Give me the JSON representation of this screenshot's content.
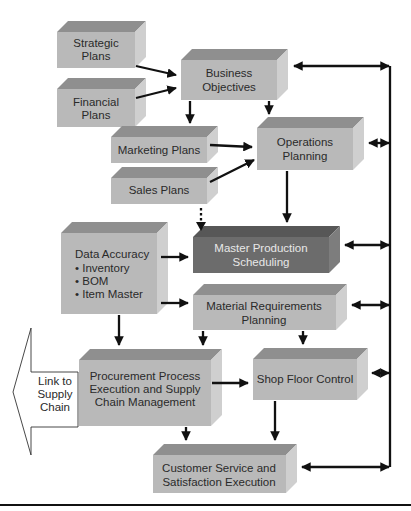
{
  "diagram": {
    "colors": {
      "box_front": "#b9b9b9",
      "box_top": "#8f8f8f",
      "box_side": "#cfcfcf",
      "mps_front": "#6c6c6c",
      "mps_top": "#575757",
      "mps_side": "#7d7d7d",
      "arrow": "#111111",
      "text": "#2a2a2a",
      "text_on_dark": "#e8e8e8"
    },
    "nodes": {
      "strategic_plans": {
        "lines": [
          "Strategic",
          "Plans"
        ]
      },
      "financial_plans": {
        "lines": [
          "Financial",
          "Plans"
        ]
      },
      "business_objectives": {
        "lines": [
          "Business",
          "Objectives"
        ]
      },
      "marketing_plans": {
        "lines": [
          "Marketing Plans"
        ]
      },
      "operations_planning": {
        "lines": [
          "Operations",
          "Planning"
        ]
      },
      "sales_plans": {
        "lines": [
          "Sales Plans"
        ]
      },
      "data_accuracy": {
        "lines": [
          "Data Accuracy",
          "• Inventory",
          "• BOM",
          "• Item Master"
        ]
      },
      "master_production_scheduling": {
        "lines": [
          "Master Production",
          "Scheduling"
        ]
      },
      "material_requirements_planning": {
        "lines": [
          "Material Requirements",
          "Planning"
        ]
      },
      "procurement": {
        "lines": [
          "Procurement Process",
          "Execution and Supply",
          "Chain Management"
        ]
      },
      "shop_floor_control": {
        "lines": [
          "Shop Floor Control"
        ]
      },
      "customer_service": {
        "lines": [
          "Customer Service and",
          "Satisfaction Execution"
        ]
      },
      "link_to_supply_chain": {
        "lines": [
          "Link to",
          "Supply",
          "Chain"
        ]
      }
    },
    "edges": [
      {
        "from": "Strategic Plans",
        "to": "Business Objectives",
        "type": "arrow"
      },
      {
        "from": "Financial Plans",
        "to": "Business Objectives",
        "type": "arrow"
      },
      {
        "from": "Business Objectives",
        "to": "Marketing Plans",
        "type": "arrow"
      },
      {
        "from": "Business Objectives",
        "to": "Operations Planning",
        "type": "arrow"
      },
      {
        "from": "Marketing Plans",
        "to": "Operations Planning",
        "type": "arrow"
      },
      {
        "from": "Sales Plans",
        "to": "Operations Planning",
        "type": "arrow"
      },
      {
        "from": "Sales Plans",
        "to": "Master Production Scheduling",
        "type": "dotted-arrow"
      },
      {
        "from": "Operations Planning",
        "to": "Master Production Scheduling",
        "type": "arrow"
      },
      {
        "from": "Data Accuracy",
        "to": "Master Production Scheduling",
        "type": "arrow"
      },
      {
        "from": "Data Accuracy",
        "to": "Material Requirements Planning",
        "type": "arrow"
      },
      {
        "from": "Data Accuracy",
        "to": "Procurement Process Execution and Supply Chain Management",
        "type": "arrow"
      },
      {
        "from": "Material Requirements Planning",
        "to": "Procurement Process Execution and Supply Chain Management",
        "type": "arrow"
      },
      {
        "from": "Material Requirements Planning",
        "to": "Shop Floor Control",
        "type": "arrow"
      },
      {
        "from": "Procurement Process Execution and Supply Chain Management",
        "to": "Shop Floor Control",
        "type": "arrow"
      },
      {
        "from": "Procurement Process Execution and Supply Chain Management",
        "to": "Customer Service and Satisfaction Execution",
        "type": "arrow"
      },
      {
        "from": "Shop Floor Control",
        "to": "Customer Service and Satisfaction Execution",
        "type": "arrow"
      },
      {
        "from": "Feedback bus",
        "to": "Business Objectives",
        "type": "bidirectional"
      },
      {
        "from": "Feedback bus",
        "to": "Operations Planning",
        "type": "bidirectional"
      },
      {
        "from": "Feedback bus",
        "to": "Master Production Scheduling",
        "type": "bidirectional"
      },
      {
        "from": "Feedback bus",
        "to": "Material Requirements Planning",
        "type": "bidirectional"
      },
      {
        "from": "Feedback bus",
        "to": "Shop Floor Control",
        "type": "bidirectional"
      },
      {
        "from": "Feedback bus",
        "to": "Customer Service and Satisfaction Execution",
        "type": "bidirectional"
      }
    ]
  }
}
